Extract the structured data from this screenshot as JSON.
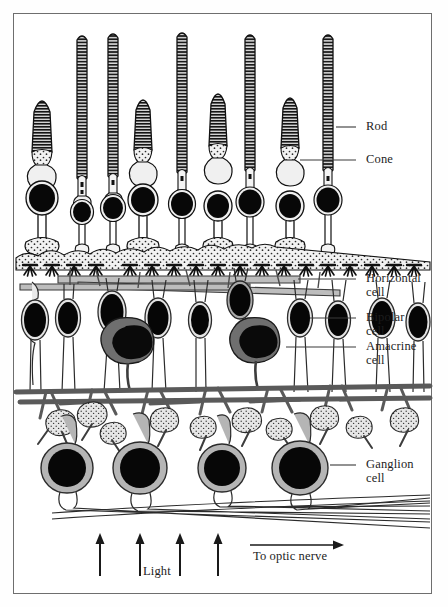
{
  "figure": {
    "frame": {
      "x": 13,
      "y": 13,
      "w": 419,
      "h": 581,
      "border_color": "#6e6e6e"
    }
  },
  "labels": [
    {
      "id": "rod",
      "text": "Rod",
      "x": 366,
      "y": 120,
      "leader": {
        "x1": 356,
        "y1": 127,
        "x2": 336,
        "y2": 127
      }
    },
    {
      "id": "cone",
      "text": "Cone",
      "x": 366,
      "y": 153,
      "leader": {
        "x1": 356,
        "y1": 160,
        "x2": 300,
        "y2": 160
      }
    },
    {
      "id": "horizontal",
      "text": "Horizontal\ncell",
      "x": 366,
      "y": 272,
      "leader": {
        "x1": 356,
        "y1": 279,
        "x2": 298,
        "y2": 279
      }
    },
    {
      "id": "bipolar",
      "text": "Bipolar\ncell",
      "x": 366,
      "y": 311,
      "leader": {
        "x1": 356,
        "y1": 318,
        "x2": 310,
        "y2": 318
      }
    },
    {
      "id": "amacrine",
      "text": "Amacrine\ncell",
      "x": 366,
      "y": 340,
      "leader": {
        "x1": 356,
        "y1": 347,
        "x2": 286,
        "y2": 347
      }
    },
    {
      "id": "ganglion",
      "text": "Ganglion\ncell",
      "x": 366,
      "y": 458,
      "leader": {
        "x1": 356,
        "y1": 465,
        "x2": 330,
        "y2": 465
      }
    }
  ],
  "annotations": {
    "light": {
      "text": "Light",
      "x": 161,
      "y": 570
    },
    "optic_nerve": {
      "text": "To optic nerve",
      "x": 253,
      "y": 556
    }
  },
  "light_arrows": {
    "count": 4,
    "xs": [
      100,
      140,
      180,
      218
    ],
    "y_tail": 575,
    "y_head": 535
  },
  "optic_nerve_arrow": {
    "x1": 250,
    "x2": 343,
    "y": 545
  },
  "colors": {
    "ink": "#1d1d1d",
    "frame": "#6e6e6e",
    "cytoplasm_light": "#efefef",
    "cytoplasm_mid": "#b9b9b9",
    "cytoplasm_dark": "#8a8a8a",
    "amacrine_body": "#6f6f6f",
    "nucleus": "#070707",
    "stipple": "#d9d9d9"
  },
  "photoreceptors": [
    {
      "type": "cone",
      "x": 42,
      "outer_top": 95,
      "outer_w": 15,
      "soma_y": 198,
      "soma_r": 17
    },
    {
      "type": "rod",
      "x": 82,
      "outer_top": 35,
      "outer_w": 10,
      "soma_y": 212,
      "soma_r": 12
    },
    {
      "type": "rod",
      "x": 113,
      "outer_top": 33,
      "outer_w": 10,
      "soma_y": 208,
      "soma_r": 13
    },
    {
      "type": "cone",
      "x": 143,
      "outer_top": 93,
      "outer_w": 14,
      "soma_y": 200,
      "soma_r": 16
    },
    {
      "type": "rod",
      "x": 182,
      "outer_top": 32,
      "outer_w": 10,
      "soma_y": 204,
      "soma_r": 14
    },
    {
      "type": "cone",
      "x": 218,
      "outer_top": 88,
      "outer_w": 15,
      "soma_y": 206,
      "soma_r": 14
    },
    {
      "type": "rod",
      "x": 250,
      "outer_top": 34,
      "outer_w": 10,
      "soma_y": 202,
      "soma_r": 15
    },
    {
      "type": "cone",
      "x": 290,
      "outer_top": 92,
      "outer_w": 15,
      "soma_y": 206,
      "soma_r": 14
    },
    {
      "type": "rod",
      "x": 328,
      "outer_top": 34,
      "outer_w": 10,
      "soma_y": 200,
      "soma_r": 15
    }
  ],
  "layers": {
    "outer_plexiform_y": 245,
    "horizontal_band_y": 278,
    "inner_nuclear_y": 315,
    "inner_plexiform_y": 390,
    "ganglion_y": 465,
    "axon_bundle_y": 505
  },
  "bipolar_cells": {
    "count": 8,
    "xs": [
      35,
      68,
      110,
      155,
      196,
      238,
      280,
      320
    ],
    "soma_y": 320,
    "rx": 13,
    "ry": 20
  },
  "amacrine_cells": {
    "count": 2,
    "xs": [
      120,
      248
    ],
    "soma_y": 340,
    "rx": 26,
    "ry": 22
  },
  "ganglion_cells": {
    "count": 4,
    "xs": [
      67,
      140,
      222,
      300
    ],
    "soma_y": 468,
    "rx": 26,
    "ry": 25,
    "nucleus_r": 19
  }
}
